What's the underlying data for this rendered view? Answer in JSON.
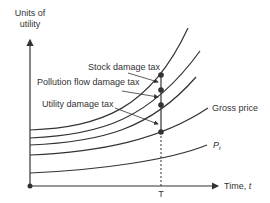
{
  "diagram": {
    "type": "economics-time-path",
    "y_axis_label_line1": "Units of",
    "y_axis_label_line2": "utility",
    "x_axis_label": "Time, ",
    "x_axis_var": "t",
    "time_marker": "T",
    "curves": [
      {
        "id": "stock-damage",
        "label": "Stock damage tax"
      },
      {
        "id": "pollution-flow",
        "label": "Pollution flow damage tax"
      },
      {
        "id": "utility-damage",
        "label": "Utility damage tax"
      },
      {
        "id": "gross-price",
        "label": "Gross price"
      },
      {
        "id": "p-t",
        "label": "P",
        "subscript": "t"
      }
    ],
    "colors": {
      "line": "#333333",
      "background": "#ffffff"
    }
  }
}
